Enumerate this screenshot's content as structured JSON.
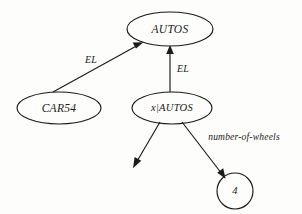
{
  "diagram": {
    "kind": "semantic-network",
    "background_color": "#fdfdfc",
    "ink_color": "#1b1b1b",
    "nodes": [
      {
        "id": "autos",
        "label": "AUTOS",
        "shape": "ellipse",
        "cx": 170,
        "cy": 29,
        "rx": 43,
        "ry": 17
      },
      {
        "id": "car54",
        "label": "CAR54",
        "shape": "ellipse",
        "cx": 59,
        "cy": 108,
        "rx": 42,
        "ry": 16
      },
      {
        "id": "x-autos",
        "label": "x|AUTOS",
        "shape": "ellipse",
        "cx": 172,
        "cy": 108,
        "rx": 40,
        "ry": 16
      },
      {
        "id": "four",
        "label": "4",
        "shape": "circle",
        "cx": 235,
        "cy": 191,
        "rx": 18,
        "ry": 18
      }
    ],
    "edges": [
      {
        "id": "car54-el-autos",
        "from": "car54",
        "to": "autos",
        "label": "EL",
        "label_x": 91,
        "label_y": 61,
        "arrow_at": "to"
      },
      {
        "id": "xautos-el-autos",
        "from": "x-autos",
        "to": "autos",
        "label": "EL",
        "label_x": 183,
        "label_y": 70,
        "arrow_at": "to"
      },
      {
        "id": "xautos-dangling-left",
        "from": "x-autos",
        "to": null,
        "label": "",
        "arrow_at": "to"
      },
      {
        "id": "xautos-number-of-wheels-four",
        "from": "x-autos",
        "to": "four",
        "label": "number-of-wheels",
        "label_x": 244,
        "label_y": 138,
        "arrow_at": "to"
      }
    ]
  }
}
